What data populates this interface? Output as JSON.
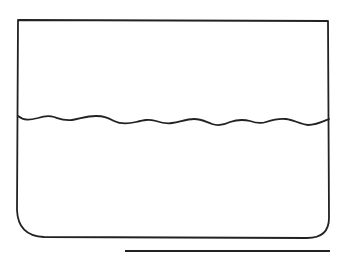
{
  "diagram": {
    "colors": {
      "stroke": "#222222",
      "background": "#ffffff"
    },
    "container": {
      "left": 18,
      "top": 20,
      "right": 329,
      "bottom": 238,
      "bottom_left_radius": 26,
      "bottom_right_radius": 20
    },
    "liquid_surface": {
      "y_approx": 120,
      "shape": "wavy"
    },
    "baseline": {
      "x1": 125,
      "x2": 330,
      "y": 251
    }
  }
}
